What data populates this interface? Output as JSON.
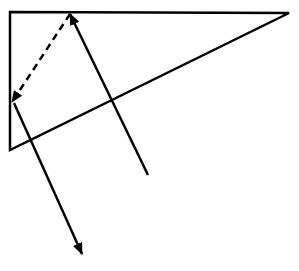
{
  "diagram": {
    "colors": {
      "stroke": "#000000",
      "background": "#ffffff"
    },
    "triangle": {
      "points": "10,12 289,13 10,150"
    },
    "rays": [
      {
        "name": "incident-ray",
        "x1": 148,
        "y1": 175,
        "x2": 70,
        "y2": 14,
        "dashed": false
      },
      {
        "name": "reflected-ray",
        "x1": 70,
        "y1": 14,
        "x2": 12,
        "y2": 102,
        "dashed": true
      },
      {
        "name": "emergent-ray",
        "x1": 14,
        "y1": 103,
        "x2": 82,
        "y2": 254,
        "dashed": false
      }
    ]
  }
}
